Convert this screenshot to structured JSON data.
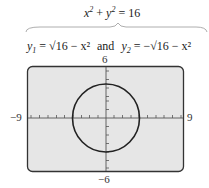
{
  "top_equation": {
    "lhs_x": "x",
    "lhs_y": "y",
    "exp": "2",
    "plus": "+",
    "rhs": "= 16"
  },
  "split_equation": {
    "y1_var": "y",
    "y1_sub": "1",
    "y1_expr": "= √16 − x²",
    "connector": "and",
    "y2_var": "y",
    "y2_sub": "2",
    "y2_expr": "= −√16 − x²"
  },
  "graph": {
    "xmin_label": "−9",
    "xmax_label": "9",
    "ymax_label": "6",
    "ymin_label": "−6",
    "background": "#e6e6e6",
    "curve": "circle radius 4"
  }
}
